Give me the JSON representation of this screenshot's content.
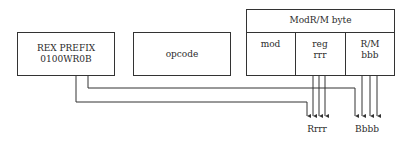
{
  "rex_prefix": {
    "title": "REX PREFIX",
    "bits": "0100WR0B"
  },
  "opcode": {
    "label": "opcode"
  },
  "modrm": {
    "title": "ModR/M byte",
    "fields": [
      {
        "name": "mod",
        "bits": ""
      },
      {
        "name": "reg",
        "bits": "rrr"
      },
      {
        "name": "R/M",
        "bits": "bbb"
      }
    ]
  },
  "outputs": {
    "reg_extended": "Rrrr",
    "rm_extended": "Bbbb"
  },
  "colors": {
    "line": "#333333",
    "background": "#ffffff",
    "text": "#2a2a2a"
  }
}
